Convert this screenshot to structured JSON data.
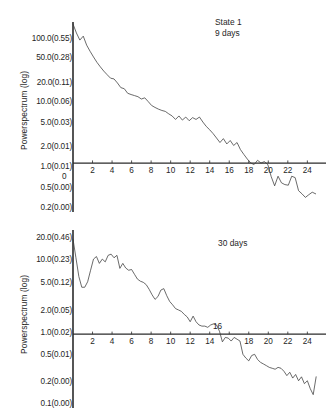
{
  "figure": {
    "background": "#ffffff",
    "ink_color": "#2b2b2b",
    "axis_title": "Powerspectrum (log)"
  },
  "panels": [
    {
      "id": "panel-top",
      "caption_line1": "State 1",
      "caption_line2": "9 days",
      "origin_label": "0"
    },
    {
      "id": "panel-bottom",
      "caption_line1": "30 days",
      "caption_line2": "",
      "inline_marker": "16"
    }
  ],
  "chart_data": [
    {
      "type": "line",
      "title": "State 1",
      "subtitle": "9 days",
      "xlabel": "",
      "ylabel": "Powerspectrum (log)",
      "y_scale": "log",
      "grid": false,
      "legend": "none",
      "xlim": [
        0,
        25.5
      ],
      "ylim": [
        0.2,
        130
      ],
      "xticks": [
        2,
        4,
        6,
        8,
        10,
        12,
        14,
        16,
        18,
        20,
        22,
        24
      ],
      "xticklabels": [
        "2",
        "4",
        "6",
        "8",
        "10",
        "12",
        "14",
        "16",
        "18",
        "20",
        "22",
        "24"
      ],
      "origin_tick_label": "0",
      "yticks": [
        100.0,
        50.0,
        20.0,
        10.0,
        5.0,
        2.0,
        1.0,
        0.5,
        0.2
      ],
      "yticklabels": [
        "100.0(0.55)",
        "50.0(0.28)",
        "20.0(0.11)",
        "10.0(0.06)",
        "5.0(0.03)",
        "2.0(0.01)",
        "1.0(0.01)",
        "0.5(0.00)",
        "0.2(0.00)"
      ],
      "x": [
        0.0,
        0.35,
        0.7,
        1.05,
        1.4,
        1.75,
        2.1,
        2.45,
        2.8,
        3.15,
        3.5,
        3.85,
        4.2,
        4.55,
        4.9,
        5.25,
        5.6,
        5.95,
        6.3,
        6.65,
        7.0,
        7.35,
        7.7,
        8.05,
        8.4,
        8.75,
        9.1,
        9.45,
        9.8,
        10.15,
        10.5,
        10.85,
        11.2,
        11.55,
        11.9,
        12.25,
        12.6,
        12.95,
        13.3,
        13.65,
        14.0,
        14.35,
        14.7,
        15.05,
        15.4,
        15.75,
        16.1,
        16.45,
        16.8,
        17.15,
        17.5,
        17.85,
        18.2,
        18.55,
        18.9,
        19.25,
        19.6,
        19.95,
        20.3,
        20.65,
        21.0,
        21.35,
        21.7,
        22.05,
        22.4,
        22.75,
        23.1,
        23.45,
        23.8,
        24.15,
        24.5,
        24.85
      ],
      "y": [
        130.0,
        95.0,
        74.0,
        85.0,
        62.0,
        50.0,
        41.0,
        34.0,
        29.0,
        25.0,
        22.0,
        19.5,
        19.0,
        16.5,
        14.0,
        13.5,
        11.5,
        11.0,
        10.6,
        10.2,
        9.4,
        9.8,
        8.6,
        7.5,
        7.0,
        6.6,
        6.3,
        6.1,
        5.6,
        5.2,
        4.6,
        5.2,
        4.5,
        5.0,
        4.4,
        4.9,
        4.6,
        5.0,
        4.2,
        3.6,
        3.2,
        2.8,
        2.4,
        2.05,
        2.35,
        1.95,
        2.2,
        1.85,
        2.05,
        1.6,
        1.35,
        1.15,
        1.0,
        0.95,
        1.1,
        1.0,
        1.05,
        0.95,
        0.62,
        0.45,
        0.63,
        0.5,
        0.47,
        0.46,
        0.63,
        0.6,
        0.38,
        0.34,
        0.3,
        0.33,
        0.36,
        0.34
      ],
      "annotations": []
    },
    {
      "type": "line",
      "title": "30 days",
      "subtitle": "",
      "xlabel": "",
      "ylabel": "Powerspectrum (log)",
      "y_scale": "log",
      "grid": false,
      "legend": "none",
      "xlim": [
        0,
        25.5
      ],
      "ylim": [
        0.1,
        26
      ],
      "xticks": [
        2,
        4,
        6,
        8,
        10,
        12,
        14,
        18,
        20,
        22,
        24
      ],
      "xticklabels": [
        "2",
        "4",
        "6",
        "8",
        "10",
        "12",
        "14",
        "18",
        "20",
        "22",
        "24"
      ],
      "marker_above_axis": {
        "label": "16",
        "x": 16
      },
      "yticks": [
        20.0,
        10.0,
        5.0,
        2.0,
        1.0,
        0.5,
        0.2,
        0.1
      ],
      "yticklabels": [
        "20.0(0.46)",
        "10.0(0.23)",
        "5.0(0.12)",
        "2.0(0.05)",
        "1.0(0.02)",
        "0.5(0.01)",
        "0.2(0.00)",
        "0.1(0.00)"
      ],
      "x": [
        0.0,
        0.3,
        0.6,
        0.9,
        1.2,
        1.5,
        1.8,
        2.1,
        2.4,
        2.7,
        3.0,
        3.3,
        3.6,
        3.9,
        4.2,
        4.5,
        4.8,
        5.1,
        5.4,
        5.7,
        6.0,
        6.3,
        6.6,
        6.9,
        7.2,
        7.5,
        7.8,
        8.1,
        8.4,
        8.7,
        9.0,
        9.3,
        9.6,
        9.9,
        10.2,
        10.5,
        10.8,
        11.1,
        11.4,
        11.7,
        12.0,
        12.3,
        12.6,
        12.9,
        13.2,
        13.5,
        13.8,
        14.1,
        14.4,
        14.7,
        15.0,
        15.3,
        15.6,
        15.9,
        16.2,
        16.5,
        16.8,
        17.1,
        17.4,
        17.7,
        18.0,
        18.3,
        18.6,
        18.9,
        19.2,
        19.5,
        19.8,
        20.1,
        20.4,
        20.7,
        21.0,
        21.3,
        21.6,
        21.9,
        22.2,
        22.5,
        22.8,
        23.1,
        23.4,
        23.7,
        24.0,
        24.3,
        24.6,
        24.9
      ],
      "y": [
        22.0,
        12.0,
        6.5,
        4.6,
        4.6,
        5.5,
        8.0,
        11.5,
        12.5,
        10.0,
        11.5,
        10.5,
        13.0,
        13.5,
        12.0,
        13.0,
        8.5,
        10.0,
        8.6,
        8.0,
        8.2,
        7.0,
        6.0,
        5.6,
        5.4,
        5.0,
        4.3,
        3.6,
        3.1,
        3.4,
        4.2,
        4.4,
        3.5,
        2.9,
        2.6,
        2.3,
        2.2,
        2.1,
        1.9,
        1.75,
        1.5,
        1.8,
        1.5,
        1.35,
        1.3,
        1.3,
        1.25,
        1.35,
        1.4,
        1.35,
        1.1,
        0.78,
        0.9,
        0.88,
        0.8,
        0.9,
        0.85,
        0.8,
        0.52,
        0.46,
        0.42,
        0.5,
        0.52,
        0.44,
        0.4,
        0.38,
        0.36,
        0.34,
        0.33,
        0.32,
        0.34,
        0.33,
        0.3,
        0.26,
        0.29,
        0.24,
        0.27,
        0.22,
        0.25,
        0.2,
        0.22,
        0.17,
        0.14,
        0.25
      ],
      "annotations": [
        {
          "text": "16",
          "x": 16,
          "position": "above-axis"
        }
      ]
    }
  ]
}
